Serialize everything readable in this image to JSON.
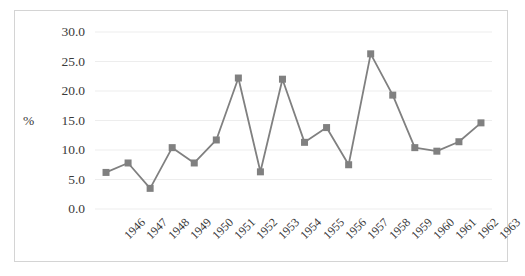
{
  "chart_data": {
    "type": "line",
    "title": "",
    "xlabel": "",
    "ylabel": "%",
    "ylim": [
      0.0,
      30.0
    ],
    "ytick_step": 5.0,
    "grid": true,
    "legend": false,
    "marker": "square",
    "series_color": "#808080",
    "categories": [
      "1946",
      "1947",
      "1948",
      "1949",
      "1950",
      "1951",
      "1952",
      "1953",
      "1954",
      "1955",
      "1956",
      "1957",
      "1958",
      "1959",
      "1960",
      "1961",
      "1962",
      "1963"
    ],
    "values": [
      6.2,
      7.8,
      3.5,
      10.4,
      7.8,
      11.7,
      22.2,
      6.3,
      22.0,
      11.3,
      13.8,
      7.5,
      26.3,
      19.3,
      10.4,
      9.8,
      11.4,
      14.6
    ],
    "ytick_labels": [
      "0.0",
      "5.0",
      "10.0",
      "15.0",
      "20.0",
      "25.0",
      "30.0"
    ],
    "series": [
      {
        "name": "%",
        "values": [
          6.2,
          7.8,
          3.5,
          10.4,
          7.8,
          11.7,
          22.2,
          6.3,
          22.0,
          11.3,
          13.8,
          7.5,
          26.3,
          19.3,
          10.4,
          9.8,
          11.4,
          14.6
        ]
      }
    ]
  },
  "style": {
    "frame_border_color": "#d4d4d4",
    "gridline_color": "#ededed",
    "text_color": "#3a3a3a",
    "plot_background": "#ffffff"
  }
}
